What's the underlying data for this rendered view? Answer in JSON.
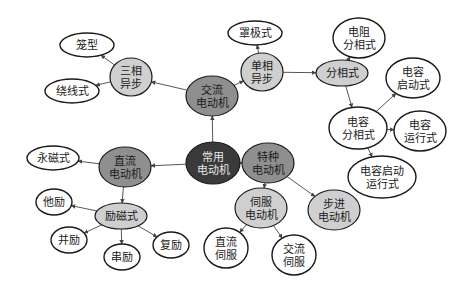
{
  "diagram": {
    "colors": {
      "root_fill": "#3a3a3a",
      "root_text": "#e6e6e6",
      "category_fill": "#8f8f8f",
      "subcategory_fill": "#cfcfcf",
      "leaf_fill": "#ffffff",
      "stroke": "#1a1a1a",
      "edge": "#444444",
      "text": "#1a1a1a"
    },
    "nodes": [
      {
        "id": "root",
        "lines": [
          "常用",
          "电动机"
        ],
        "cx": 213,
        "cy": 163,
        "rx": 27,
        "ry": 21,
        "level": "root"
      },
      {
        "id": "ac",
        "lines": [
          "交流",
          "电动机"
        ],
        "cx": 212,
        "cy": 96,
        "rx": 26,
        "ry": 20,
        "level": "category"
      },
      {
        "id": "dc",
        "lines": [
          "直流",
          "电动机"
        ],
        "cx": 125,
        "cy": 167,
        "rx": 26,
        "ry": 20,
        "level": "category"
      },
      {
        "id": "special",
        "lines": [
          "特种",
          "电动机"
        ],
        "cx": 268,
        "cy": 163,
        "rx": 26,
        "ry": 20,
        "level": "category"
      },
      {
        "id": "three_phase",
        "lines": [
          "三相",
          "异步"
        ],
        "cx": 131,
        "cy": 77,
        "rx": 21,
        "ry": 19,
        "level": "subcategory"
      },
      {
        "id": "single_phase",
        "lines": [
          "单相",
          "异步"
        ],
        "cx": 262,
        "cy": 72,
        "rx": 21,
        "ry": 19,
        "level": "subcategory"
      },
      {
        "id": "split_phase",
        "lines": [
          "分相式"
        ],
        "cx": 342,
        "cy": 73,
        "rx": 26,
        "ry": 13,
        "level": "subcategory"
      },
      {
        "id": "excited",
        "lines": [
          "励磁式"
        ],
        "cx": 121,
        "cy": 216,
        "rx": 26,
        "ry": 13,
        "level": "subcategory"
      },
      {
        "id": "servo",
        "lines": [
          "伺服",
          "电动机"
        ],
        "cx": 261,
        "cy": 208,
        "rx": 26,
        "ry": 20,
        "level": "subcategory"
      },
      {
        "id": "stepper",
        "lines": [
          "步进",
          "电动机"
        ],
        "cx": 334,
        "cy": 210,
        "rx": 26,
        "ry": 20,
        "level": "subcategory"
      },
      {
        "id": "cage",
        "lines": [
          "笼型"
        ],
        "cx": 87,
        "cy": 45,
        "rx": 27,
        "ry": 12,
        "level": "leaf"
      },
      {
        "id": "wound",
        "lines": [
          "绕线式"
        ],
        "cx": 72,
        "cy": 91,
        "rx": 27,
        "ry": 12,
        "level": "leaf"
      },
      {
        "id": "shaded_pole",
        "lines": [
          "罩极式"
        ],
        "cx": 255,
        "cy": 33,
        "rx": 27,
        "ry": 12,
        "level": "leaf"
      },
      {
        "id": "resistor_split",
        "lines": [
          "电阻",
          "分相式"
        ],
        "cx": 359,
        "cy": 38,
        "rx": 26,
        "ry": 20,
        "level": "leaf"
      },
      {
        "id": "cap_start",
        "lines": [
          "电容",
          "启动式"
        ],
        "cx": 413,
        "cy": 78,
        "rx": 27,
        "ry": 20,
        "level": "leaf"
      },
      {
        "id": "cap_split",
        "lines": [
          "电容",
          "分相式"
        ],
        "cx": 358,
        "cy": 128,
        "rx": 29,
        "ry": 21,
        "level": "leaf"
      },
      {
        "id": "cap_run",
        "lines": [
          "电容",
          "运行式"
        ],
        "cx": 420,
        "cy": 131,
        "rx": 26,
        "ry": 20,
        "level": "leaf"
      },
      {
        "id": "cap_start_run",
        "lines": [
          "电容启动",
          "运行式"
        ],
        "cx": 382,
        "cy": 177,
        "rx": 34,
        "ry": 21,
        "level": "leaf"
      },
      {
        "id": "permanent_magnet",
        "lines": [
          "永磁式"
        ],
        "cx": 53,
        "cy": 158,
        "rx": 26,
        "ry": 12,
        "level": "leaf"
      },
      {
        "id": "separately_excited",
        "lines": [
          "他励"
        ],
        "cx": 54,
        "cy": 202,
        "rx": 18,
        "ry": 13,
        "level": "leaf"
      },
      {
        "id": "shunt",
        "lines": [
          "并励"
        ],
        "cx": 69,
        "cy": 240,
        "rx": 18,
        "ry": 13,
        "level": "leaf"
      },
      {
        "id": "series",
        "lines": [
          "串励"
        ],
        "cx": 122,
        "cy": 257,
        "rx": 18,
        "ry": 13,
        "level": "leaf"
      },
      {
        "id": "compound",
        "lines": [
          "复励"
        ],
        "cx": 171,
        "cy": 245,
        "rx": 18,
        "ry": 13,
        "level": "leaf"
      },
      {
        "id": "dc_servo",
        "lines": [
          "直流",
          "伺服"
        ],
        "cx": 226,
        "cy": 248,
        "rx": 22,
        "ry": 20,
        "level": "leaf"
      },
      {
        "id": "ac_servo",
        "lines": [
          "交流",
          "伺服"
        ],
        "cx": 294,
        "cy": 255,
        "rx": 22,
        "ry": 20,
        "level": "leaf"
      }
    ],
    "edges": [
      {
        "from": "root",
        "to": "ac"
      },
      {
        "from": "root",
        "to": "dc"
      },
      {
        "from": "root",
        "to": "special"
      },
      {
        "from": "ac",
        "to": "three_phase"
      },
      {
        "from": "ac",
        "to": "single_phase"
      },
      {
        "from": "three_phase",
        "to": "cage"
      },
      {
        "from": "three_phase",
        "to": "wound"
      },
      {
        "from": "single_phase",
        "to": "shaded_pole"
      },
      {
        "from": "single_phase",
        "to": "split_phase"
      },
      {
        "from": "split_phase",
        "to": "resistor_split"
      },
      {
        "from": "split_phase",
        "to": "cap_split"
      },
      {
        "from": "cap_split",
        "to": "cap_start"
      },
      {
        "from": "cap_split",
        "to": "cap_run"
      },
      {
        "from": "cap_split",
        "to": "cap_start_run"
      },
      {
        "from": "dc",
        "to": "permanent_magnet"
      },
      {
        "from": "dc",
        "to": "excited"
      },
      {
        "from": "excited",
        "to": "separately_excited"
      },
      {
        "from": "excited",
        "to": "shunt"
      },
      {
        "from": "excited",
        "to": "series"
      },
      {
        "from": "excited",
        "to": "compound"
      },
      {
        "from": "special",
        "to": "servo"
      },
      {
        "from": "special",
        "to": "stepper"
      },
      {
        "from": "servo",
        "to": "dc_servo"
      },
      {
        "from": "servo",
        "to": "ac_servo"
      }
    ]
  }
}
